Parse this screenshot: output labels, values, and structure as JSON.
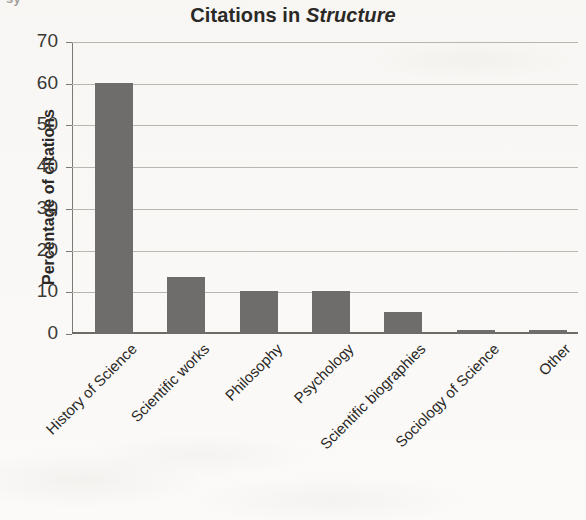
{
  "page": {
    "cutoff_text_above": "sy",
    "background_color": "#fbfaf8"
  },
  "chart_data": {
    "type": "bar",
    "title": "Citations in Structure",
    "title_plain": "Citations in ",
    "title_italic": "Structure",
    "xlabel": "",
    "ylabel": "Percentage of citations",
    "ylim": [
      0,
      70
    ],
    "ytick_step": 10,
    "yticks": [
      70,
      60,
      50,
      40,
      30,
      20,
      10,
      0
    ],
    "grid": true,
    "legend": false,
    "bar_color": "#6f6d6b",
    "gridline_color": "#b9b6b2",
    "axis_color": "#6e6b67",
    "categories": [
      "History of Science",
      "Scientific works",
      "Philosophy",
      "Psychology",
      "Scientific biographies",
      "Sociology of Science",
      "Other"
    ],
    "values": [
      60,
      13.4,
      10,
      10,
      5,
      0.8,
      0.8
    ]
  }
}
